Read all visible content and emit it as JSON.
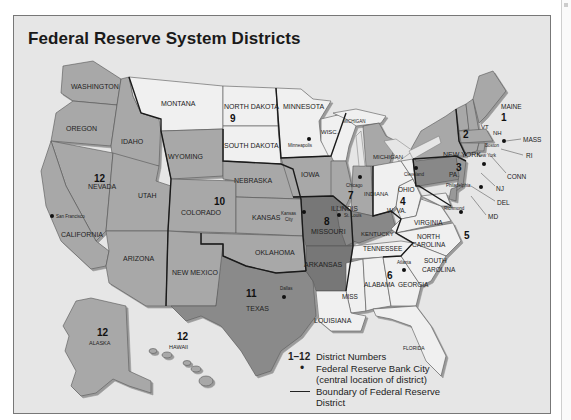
{
  "title": "Federal Reserve System Districts",
  "colors": {
    "background": "#e6e6e6",
    "district_light": "#f0f0f0",
    "district_medium": "#a8a8a8",
    "district_dark": "#8a8a8a",
    "district_darkest": "#777777",
    "boundary": "#1a1a1a"
  },
  "states": {
    "washington": "WASHINGTON",
    "oregon": "OREGON",
    "idaho": "IDAHO",
    "montana": "MONTANA",
    "wyoming": "WYOMING",
    "nevada": "NEVADA",
    "utah": "UTAH",
    "colorado": "COLORADO",
    "california": "CALIFORNIA",
    "arizona": "ARIZONA",
    "new_mexico": "NEW MEXICO",
    "north_dakota": "NORTH DAKOTA",
    "south_dakota": "SOUTH DAKOTA",
    "minnesota": "MINNESOTA",
    "nebraska": "NEBRASKA",
    "kansas": "KANSAS",
    "oklahoma": "OKLAHOMA",
    "texas": "TEXAS",
    "iowa": "IOWA",
    "missouri": "MISSOURI",
    "arkansas": "ARKANSAS",
    "louisiana": "LOUISIANA",
    "wisc": "WISC.",
    "michigan_up": "MICHIGAN",
    "michigan": "MICHIGAN",
    "illinois": "ILLINOIS",
    "indiana": "INDIANA",
    "kentucky": "KENTUCKY",
    "tennessee": "TENNESSEE",
    "miss": "MISS",
    "alabama": "ALABAMA",
    "georgia": "GEORGIA",
    "florida": "FLORIDA",
    "ohio": "OHIO",
    "wva": "W. VA.",
    "virginia": "VIRGINIA",
    "north_carolina_1": "NORTH",
    "north_carolina_2": "CAROLINA",
    "south_carolina_1": "SOUTH",
    "south_carolina_2": "CAROLINA",
    "pa": "PA.",
    "new_york": "NEW YORK",
    "vt": "VT",
    "nh": "NH",
    "maine": "MAINE",
    "mass": "MASS",
    "ri": "RI",
    "conn": "CONN",
    "nj": "NJ",
    "del": "DEL",
    "md": "MD",
    "alaska": "ALASKA",
    "hawaii": "HAWAII"
  },
  "districts": {
    "d1": "1",
    "d2": "2",
    "d3": "3",
    "d4": "4",
    "d5": "5",
    "d6": "6",
    "d7": "7",
    "d8": "8",
    "d9": "9",
    "d10": "10",
    "d11": "11",
    "d12": "12",
    "d12_alaska": "12",
    "d12_hawaii": "12"
  },
  "cities": {
    "boston": "Boston",
    "new_york": "New York",
    "philadelphia": "Philadelphia",
    "cleveland": "Cleveland",
    "richmond": "Richmond",
    "atlanta": "Atlanta",
    "chicago": "Chicago",
    "st_louis": "St. Louis",
    "minneapolis": "Minneapolis",
    "kansas_city_1": "Kansas",
    "kansas_city_2": "City",
    "dallas": "Dallas",
    "san_francisco": "San Francisco"
  },
  "legend": {
    "numbers_key": "1–12",
    "numbers_label": "District Numbers",
    "city_key": "•",
    "city_label_1": "Federal Reserve Bank City",
    "city_label_2": "(central location of district)",
    "boundary_label_1": "Boundary of Federal Reserve",
    "boundary_label_2": "District"
  }
}
